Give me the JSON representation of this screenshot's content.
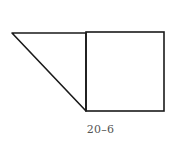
{
  "figure": {
    "caption": "20–6",
    "stroke_color": "#1a1a1a",
    "stroke_width": 1.6,
    "shapes": {
      "triangle": {
        "points": [
          [
            12,
            33
          ],
          [
            86,
            33
          ],
          [
            86,
            111
          ]
        ]
      },
      "square": {
        "x": 86,
        "y": 32,
        "width": 78,
        "height": 79
      }
    }
  }
}
